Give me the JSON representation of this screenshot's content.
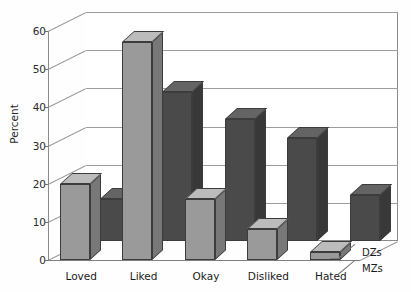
{
  "chart_data": {
    "type": "bar",
    "title": "",
    "xlabel": "",
    "ylabel": "Percent",
    "categories": [
      "Loved",
      "Liked",
      "Okay",
      "Disliked",
      "Hated"
    ],
    "series": [
      {
        "name": "DZs",
        "values": [
          20,
          57,
          16,
          8,
          2
        ],
        "color": "#9a9a9a"
      },
      {
        "name": "MZs",
        "values": [
          11,
          39,
          32,
          27,
          12
        ],
        "color": "#4a4a4a"
      }
    ],
    "ylim": [
      0,
      60
    ],
    "yticks": [
      0,
      10,
      20,
      30,
      40,
      50,
      60
    ],
    "ytick_labels": [
      "0",
      "10",
      "20",
      "30",
      "40",
      "50",
      "60"
    ],
    "grid": true,
    "legend_position": "right-bottom",
    "projection": "3d"
  },
  "axes": {
    "y_title": "Percent",
    "y_ticks": [
      "60",
      "50",
      "40",
      "30",
      "20",
      "10",
      "0"
    ]
  },
  "categories": [
    {
      "label": "Loved"
    },
    {
      "label": "Liked"
    },
    {
      "label": "Okay"
    },
    {
      "label": "Disliked"
    },
    {
      "label": "Hated"
    }
  ],
  "legend": {
    "back_row": "DZs",
    "front_row": "MZs"
  },
  "title": {
    "text": ""
  }
}
